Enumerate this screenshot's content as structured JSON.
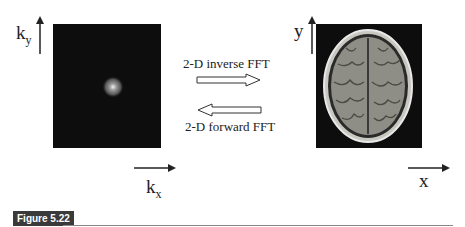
{
  "left_panel": {
    "label_y": "k",
    "label_y_sub": "y",
    "label_x": "k",
    "label_x_sub": "x",
    "image": "k-space magnitude (dark with bright center spot)"
  },
  "right_panel": {
    "label_y": "y",
    "label_x": "x",
    "image": "axial MRI brain slice"
  },
  "arrows": {
    "inverse_label": "2-D inverse FFT",
    "forward_label": "2-D forward FFT"
  },
  "caption": {
    "figure_label": "Figure 5.22"
  },
  "colors": {
    "panel_bg": "#0d0d0d",
    "tag_bg": "#3a3a3a",
    "rule": "#888888"
  }
}
